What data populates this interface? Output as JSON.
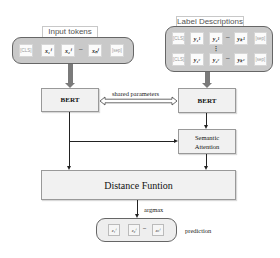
{
  "input": {
    "title": "Input tokens",
    "tokens": [
      "[CLS]",
      "x₁ⁱ",
      "x₂ⁱ",
      "–",
      "xₙⁱ",
      "[sep]"
    ]
  },
  "labels": {
    "title": "Label Descriptions",
    "row1": [
      "[CLS]",
      "y₁¹",
      "y₂¹",
      "–",
      "yₖ¹",
      "[sep]"
    ],
    "row2": [
      "[CLS]",
      "y₁ᶜ",
      "y₂ᶜ",
      "–",
      "yₖᶜ",
      "[sep]"
    ],
    "ellipsis": "⋮"
  },
  "encoder_left": {
    "label": "BERT"
  },
  "encoder_right": {
    "label": "BERT"
  },
  "shared": {
    "label": "shared parameters"
  },
  "attention": {
    "line1": "Semantic",
    "line2": "Attention"
  },
  "distance": {
    "label": "Distance Funtion"
  },
  "argmax": {
    "label": "argmax"
  },
  "prediction": {
    "label": "prediction",
    "tokens": [
      "z₁ⁱ",
      "z₂ⁱ",
      "–",
      "zₙⁱ"
    ]
  },
  "colors": {
    "container_fill": "#c9c9c9",
    "box_fill": "#f1f1f1",
    "thick_arrow": "#7a7a7a"
  }
}
